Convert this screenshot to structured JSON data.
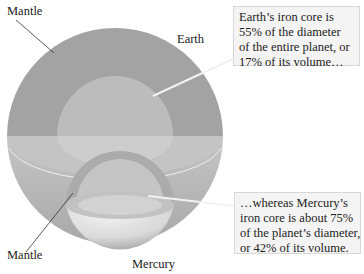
{
  "labels": {
    "earth_mantle": "Mantle",
    "earth": "Earth",
    "mercury_mantle": "Mantle",
    "mercury": "Mercury"
  },
  "callouts": {
    "earth": {
      "lines": [
        "Earth’s iron core is",
        "55% of the diameter",
        "of the entire planet, or",
        "17% of its volume…"
      ]
    },
    "mercury": {
      "lines": [
        "…whereas Mercury’s",
        "iron core is about 75%",
        "of the planet’s diameter,",
        "or 42% of its volume."
      ]
    }
  },
  "facts": {
    "earth_core_diameter_pct": 55,
    "earth_core_volume_pct": 17,
    "mercury_core_diameter_pct": 75,
    "mercury_core_volume_pct": 42
  },
  "colors": {
    "earth_mantle": "#a3a3a3",
    "earth_core": "#bdbdbd",
    "earth_cut_plane": "#c4c4c4",
    "mercury_mantle": "#ababab",
    "mercury_core": "#c9c9c9",
    "callout_bg": "#f4f4f4"
  }
}
